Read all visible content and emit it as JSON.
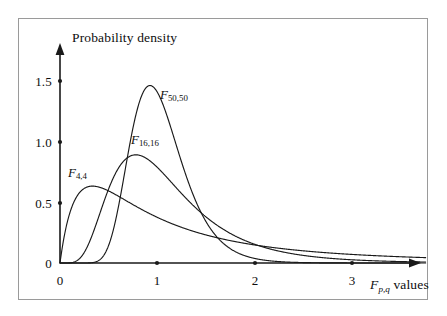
{
  "figure": {
    "background_color": "#ffffff",
    "ink_color": "#1a1a1a",
    "frame_color": "#9a9a9a"
  },
  "axes": {
    "y_title": "Probability density",
    "x_title_var": "F",
    "x_title_sub": "p,q",
    "x_title_rest": " values",
    "x_ticks": [
      "0",
      "1",
      "2",
      "3"
    ],
    "y_ticks": [
      "0",
      "0.5",
      "1.0",
      "1.5"
    ]
  },
  "curves": {
    "f44": {
      "var": "F",
      "sub": "4,4"
    },
    "f1616": {
      "var": "F",
      "sub": "16,16"
    },
    "f5050": {
      "var": "F",
      "sub": "50,50"
    }
  },
  "chart_data": {
    "type": "line",
    "title": "",
    "xlabel": "F_{p,q} values",
    "ylabel": "Probability density",
    "xlim": [
      0,
      3.75
    ],
    "ylim": [
      0,
      1.6
    ],
    "grid": false,
    "legend": "inline annotations next to each curve",
    "x": [
      0,
      0.05,
      0.1,
      0.15,
      0.2,
      0.25,
      0.3,
      0.35,
      0.4,
      0.45,
      0.5,
      0.6,
      0.7,
      0.8,
      0.9,
      1.0,
      1.1,
      1.2,
      1.3,
      1.4,
      1.5,
      1.6,
      1.8,
      2.0,
      2.25,
      2.5,
      2.75,
      3.0,
      3.25,
      3.5,
      3.75
    ],
    "series": [
      {
        "name": "F_{4,4}",
        "label": "F 4,4",
        "annotation_x": 0.18,
        "annotation_y": 0.72,
        "peak": {
          "x": 0.4,
          "y": 0.58
        },
        "values": [
          0,
          0.177,
          0.301,
          0.394,
          0.463,
          0.513,
          0.549,
          0.573,
          0.588,
          0.596,
          0.598,
          0.589,
          0.569,
          0.543,
          0.514,
          0.484,
          0.454,
          0.425,
          0.397,
          0.371,
          0.346,
          0.323,
          0.283,
          0.249,
          0.213,
          0.183,
          0.159,
          0.139,
          0.122,
          0.107,
          0.095
        ]
      },
      {
        "name": "F_{16,16}",
        "label": "F 16,16",
        "annotation_x": 0.82,
        "annotation_y": 1.06,
        "peak": {
          "x": 0.8,
          "y": 0.88
        },
        "values": [
          0,
          0.0003,
          0.009,
          0.046,
          0.122,
          0.228,
          0.345,
          0.457,
          0.556,
          0.638,
          0.702,
          0.786,
          0.826,
          0.836,
          0.826,
          0.803,
          0.772,
          0.736,
          0.697,
          0.657,
          0.617,
          0.578,
          0.504,
          0.437,
          0.366,
          0.306,
          0.257,
          0.217,
          0.184,
          0.157,
          0.134
        ]
      },
      {
        "name": "F_{50,50}",
        "label": "F 50,50",
        "annotation_x": 1.06,
        "annotation_y": 1.38,
        "peak": {
          "x": 0.94,
          "y": 1.45
        },
        "values": [
          0,
          0,
          0,
          0.0,
          0.0003,
          0.004,
          0.021,
          0.068,
          0.156,
          0.286,
          0.447,
          0.8,
          1.116,
          1.329,
          1.425,
          1.423,
          1.354,
          1.245,
          1.118,
          0.987,
          0.861,
          0.744,
          0.546,
          0.396,
          0.262,
          0.173,
          0.115,
          0.077,
          0.052,
          0.036,
          0.025
        ]
      }
    ]
  }
}
